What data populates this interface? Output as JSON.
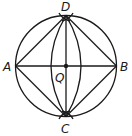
{
  "diagram": {
    "type": "geometric-construction",
    "colors": {
      "stroke": "#1a1a1a",
      "background": "#ffffff"
    },
    "points": {
      "A": {
        "label": "A"
      },
      "B": {
        "label": "B"
      },
      "C": {
        "label": "C"
      },
      "D": {
        "label": "D"
      },
      "Q": {
        "label": "Q"
      }
    },
    "segments": [
      "AB",
      "DC",
      "AD",
      "DB",
      "BC",
      "CA"
    ],
    "circle": {
      "center": "Q",
      "through": [
        "A",
        "B",
        "C",
        "D"
      ]
    },
    "arcs": [
      "left lens arc D-C",
      "right lens arc D-C",
      "construction marks at D",
      "construction marks at C"
    ]
  }
}
